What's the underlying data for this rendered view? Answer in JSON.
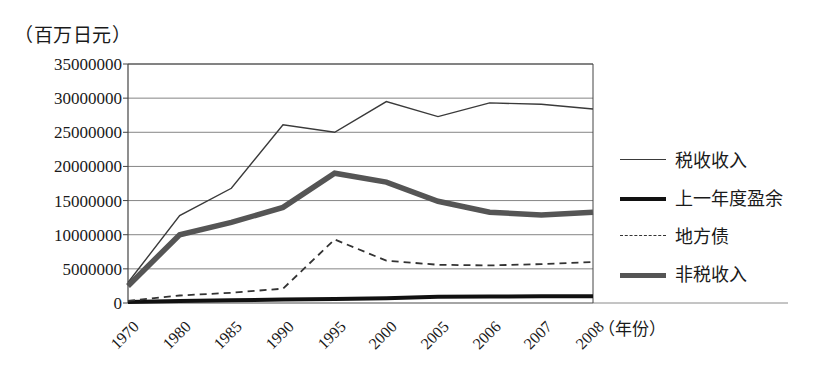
{
  "chart_data": {
    "type": "line",
    "title": "",
    "unit_label": "（百万日元）",
    "xlabel": "（年份）",
    "ylabel": "",
    "categories": [
      "1970",
      "1980",
      "1985",
      "1990",
      "1995",
      "2000",
      "2005",
      "2006",
      "2007",
      "2008"
    ],
    "ylim": [
      0,
      35000000
    ],
    "ytick_values": [
      0,
      5000000,
      10000000,
      15000000,
      20000000,
      25000000,
      30000000,
      35000000
    ],
    "ytick_labels": [
      "0",
      "5000000",
      "10000000",
      "15000000",
      "20000000",
      "25000000",
      "30000000",
      "35000000"
    ],
    "grid": true,
    "legend_position": "right",
    "series": [
      {
        "name": "税收收入",
        "style": "thin-solid",
        "color": "#3a3a3a",
        "values": [
          3000000,
          12800000,
          16800000,
          26100000,
          25000000,
          29500000,
          27300000,
          29300000,
          29100000,
          28400000
        ]
      },
      {
        "name": "上一年度盈余",
        "style": "thick-solid-black",
        "color": "#111111",
        "values": [
          150000,
          300000,
          400000,
          500000,
          600000,
          700000,
          900000,
          950000,
          1000000,
          1000000
        ]
      },
      {
        "name": "地方债",
        "style": "dashed",
        "color": "#333333",
        "values": [
          300000,
          1100000,
          1500000,
          2100000,
          9300000,
          6200000,
          5600000,
          5500000,
          5700000,
          6000000
        ]
      },
      {
        "name": "非税收入",
        "style": "thick-solid-gray",
        "color": "#555555",
        "values": [
          2500000,
          10000000,
          11800000,
          14000000,
          19000000,
          17700000,
          14900000,
          13300000,
          12900000,
          13300000
        ]
      }
    ]
  },
  "legend": {
    "items": [
      {
        "label": "税收收入"
      },
      {
        "label": "上一年度盈余"
      },
      {
        "label": "地方债"
      },
      {
        "label": "非税收入"
      }
    ]
  }
}
